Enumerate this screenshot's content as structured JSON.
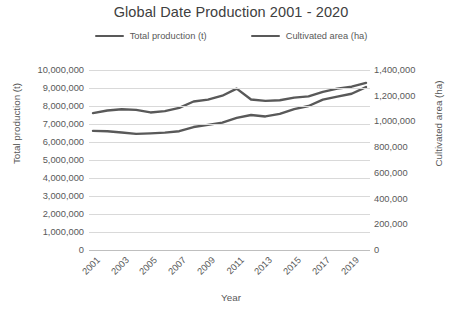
{
  "chart_data": {
    "type": "line",
    "title": "Global Date Production 2001 - 2020",
    "xlabel": "Year",
    "ylabel": "Total production (t)",
    "y2label": "Cultivated area (ha)",
    "grid": true,
    "legend_position": "top",
    "x": [
      2001,
      2002,
      2003,
      2004,
      2005,
      2006,
      2007,
      2008,
      2009,
      2010,
      2011,
      2012,
      2013,
      2014,
      2015,
      2016,
      2017,
      2018,
      2019,
      2020
    ],
    "xtick_labels": [
      "2001",
      "2003",
      "2005",
      "2007",
      "2009",
      "2011",
      "2013",
      "2015",
      "2017",
      "2019"
    ],
    "ylim": [
      0,
      10000000
    ],
    "ytick_labels": [
      "10,000,000",
      "9,000,000",
      "8,000,000",
      "7,000,000",
      "6,000,000",
      "5,000,000",
      "4,000,000",
      "3,000,000",
      "2,000,000",
      "1,000,000",
      "0"
    ],
    "y2lim": [
      0,
      1400000
    ],
    "y2tick_labels": [
      "1,400,000",
      "1,200,000",
      "1,000,000",
      "800,000",
      "600,000",
      "400,000",
      "200,000",
      "0"
    ],
    "series": [
      {
        "name": "Total production (t)",
        "axis": "left",
        "color": "#595959",
        "values": [
          6620000,
          6600000,
          6530000,
          6450000,
          6480000,
          6520000,
          6600000,
          6830000,
          6950000,
          7080000,
          7340000,
          7500000,
          7420000,
          7560000,
          7830000,
          8000000,
          8350000,
          8520000,
          8680000,
          9050000
        ]
      },
      {
        "name": "Cultivated area (ha)",
        "axis": "right",
        "color": "#595959",
        "values": [
          1065000,
          1085000,
          1095000,
          1090000,
          1070000,
          1080000,
          1105000,
          1155000,
          1170000,
          1200000,
          1255000,
          1170000,
          1160000,
          1165000,
          1185000,
          1195000,
          1230000,
          1255000,
          1270000,
          1300000
        ]
      }
    ]
  },
  "caption": {
    "text": ""
  }
}
